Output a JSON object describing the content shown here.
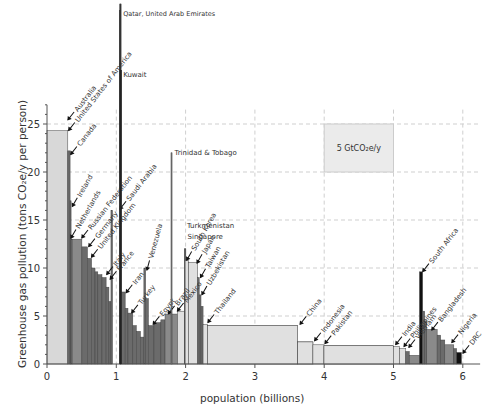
{
  "chart_data": {
    "type": "bar",
    "subtype": "variable-width bar (area = total emissions)",
    "title": "",
    "xlabel": "population (billions)",
    "ylabel": "Greenhouse gas pollution (tons CO2e/y per person)",
    "xlim": [
      0,
      6.2
    ],
    "ylim": [
      0,
      27
    ],
    "xticks": [
      0,
      1,
      2,
      3,
      4,
      5,
      6
    ],
    "yticks": [
      0,
      5,
      10,
      15,
      20,
      25
    ],
    "grid": true,
    "legend_box": {
      "label": "5 GtCO₂e/y",
      "x0": 4.0,
      "x1": 5.0,
      "y0": 20,
      "y1": 25
    },
    "bars": [
      {
        "name": "Australia",
        "x": 0.0,
        "w": 0.0,
        "h": 26.0
      },
      {
        "name": "United States of America",
        "x": 0.0,
        "w": 0.3,
        "h": 24.3
      },
      {
        "name": "Canada",
        "x": 0.3,
        "w": 0.033,
        "h": 22.2
      },
      {
        "name": "Ireland",
        "x": 0.333,
        "w": 0.01,
        "h": 17.0
      },
      {
        "name": "Netherlands",
        "x": 0.343,
        "w": 0.02,
        "h": 13.0
      },
      {
        "name": "Russian Federation",
        "x": 0.363,
        "w": 0.14,
        "h": 13.0
      },
      {
        "name": "Germany",
        "x": 0.503,
        "w": 0.08,
        "h": 12.2
      },
      {
        "name": "United Kingdom",
        "x": 0.583,
        "w": 0.06,
        "h": 11.0
      },
      {
        "name": "",
        "x": 0.643,
        "w": 0.05,
        "h": 10.0
      },
      {
        "name": "",
        "x": 0.693,
        "w": 0.04,
        "h": 9.6
      },
      {
        "name": "Italy",
        "x": 0.733,
        "w": 0.06,
        "h": 9.3
      },
      {
        "name": "France",
        "x": 0.793,
        "w": 0.06,
        "h": 9.0
      },
      {
        "name": "",
        "x": 0.853,
        "w": 0.04,
        "h": 8.0
      },
      {
        "name": "",
        "x": 0.893,
        "w": 0.03,
        "h": 6.5
      },
      {
        "name": "Saudi Arabia",
        "x": 0.923,
        "w": 0.022,
        "h": 16.0
      },
      {
        "name": "Qatar, United Arab Emirates",
        "x": 1.05,
        "w": 0.005,
        "h": 52.0
      },
      {
        "name": "Kuwait",
        "x": 1.055,
        "w": 0.003,
        "h": 38.0
      },
      {
        "name": "Iran",
        "x": 1.058,
        "w": 0.07,
        "h": 7.5
      },
      {
        "name": "",
        "x": 1.128,
        "w": 0.04,
        "h": 5.8
      },
      {
        "name": "Turkey",
        "x": 1.168,
        "w": 0.07,
        "h": 5.3
      },
      {
        "name": "",
        "x": 1.238,
        "w": 0.05,
        "h": 4.0
      },
      {
        "name": "",
        "x": 1.288,
        "w": 0.06,
        "h": 3.4
      },
      {
        "name": "",
        "x": 1.348,
        "w": 0.05,
        "h": 2.8
      },
      {
        "name": "Venezuela",
        "x": 1.398,
        "w": 0.025,
        "h": 10.0
      },
      {
        "name": "",
        "x": 1.423,
        "w": 0.04,
        "h": 6.8
      },
      {
        "name": "Egypt",
        "x": 1.463,
        "w": 0.08,
        "h": 4.0
      },
      {
        "name": "",
        "x": 1.543,
        "w": 0.1,
        "h": 4.3
      },
      {
        "name": "",
        "x": 1.643,
        "w": 0.06,
        "h": 4.6
      },
      {
        "name": "Brazil",
        "x": 1.703,
        "w": 0.18,
        "h": 5.2
      },
      {
        "name": "Trinidad & Tobago",
        "x": 1.79,
        "w": 0.002,
        "h": 22.0
      },
      {
        "name": "Mexico",
        "x": 1.883,
        "w": 0.1,
        "h": 5.5
      },
      {
        "name": "Turkmenistan",
        "x": 1.983,
        "w": 0.006,
        "h": 12.0
      },
      {
        "name": "Singapore",
        "x": 1.989,
        "w": 0.004,
        "h": 12.0
      },
      {
        "name": "South Korea",
        "x": 1.993,
        "w": 0.05,
        "h": 10.8
      },
      {
        "name": "Japan",
        "x": 2.043,
        "w": 0.13,
        "h": 10.6
      },
      {
        "name": "Taiwan",
        "x": 2.173,
        "w": 0.023,
        "h": 9.0
      },
      {
        "name": "Uzbekistan",
        "x": 2.196,
        "w": 0.026,
        "h": 7.2
      },
      {
        "name": "",
        "x": 2.222,
        "w": 0.03,
        "h": 6.0
      },
      {
        "name": "Thailand",
        "x": 2.252,
        "w": 0.065,
        "h": 4.1
      },
      {
        "name": "",
        "x": 2.317,
        "w": 1.3,
        "h": 4.0
      },
      {
        "name": "China",
        "x": 2.317,
        "w": 1.3,
        "h": 4.0
      },
      {
        "name": "",
        "x": 3.617,
        "w": 0.22,
        "h": 2.3
      },
      {
        "name": "Indonesia",
        "x": 3.617,
        "w": 0.22,
        "h": 2.3
      },
      {
        "name": "Pakistan",
        "x": 3.837,
        "w": 0.16,
        "h": 2.0
      },
      {
        "name": "",
        "x": 3.997,
        "w": 1.0,
        "h": 1.9
      },
      {
        "name": "India",
        "x": 3.997,
        "w": 1.0,
        "h": 1.9
      },
      {
        "name": "Philippines",
        "x": 4.997,
        "w": 0.09,
        "h": 1.8
      },
      {
        "name": "Vietnam",
        "x": 5.087,
        "w": 0.09,
        "h": 1.6
      },
      {
        "name": "",
        "x": 5.177,
        "w": 0.05,
        "h": 1.3
      },
      {
        "name": "",
        "x": 5.227,
        "w": 0.15,
        "h": 0.9
      },
      {
        "name": "South Africa",
        "x": 5.375,
        "w": 0.045,
        "h": 9.6
      },
      {
        "name": "",
        "x": 5.42,
        "w": 0.03,
        "h": 5.5
      },
      {
        "name": "",
        "x": 5.45,
        "w": 0.03,
        "h": 4.5
      },
      {
        "name": "Bangladesh",
        "x": 5.48,
        "w": 0.15,
        "h": 3.6
      },
      {
        "name": "",
        "x": 5.63,
        "w": 0.05,
        "h": 3.0
      },
      {
        "name": "",
        "x": 5.68,
        "w": 0.06,
        "h": 2.5
      },
      {
        "name": "Nigeria",
        "x": 5.74,
        "w": 0.13,
        "h": 2.0
      },
      {
        "name": "",
        "x": 5.87,
        "w": 0.04,
        "h": 1.6
      },
      {
        "name": "DRC",
        "x": 5.91,
        "w": 0.07,
        "h": 1.2
      }
    ],
    "annotations": [
      {
        "text": "Australia",
        "x": 0.32,
        "y": 25.6,
        "rot": -52
      },
      {
        "text": "United States of America",
        "x": 0.33,
        "y": 24.5,
        "rot": -52
      },
      {
        "text": "Canada",
        "x": 0.36,
        "y": 22.0,
        "rot": -52
      },
      {
        "text": "Ireland",
        "x": 0.38,
        "y": 16.6,
        "rot": -60
      },
      {
        "text": "Netherlands",
        "x": 0.36,
        "y": 13.3,
        "rot": -60
      },
      {
        "text": "Russian Federation",
        "x": 0.52,
        "y": 13.3,
        "rot": -52
      },
      {
        "text": "Germany",
        "x": 0.62,
        "y": 12.4,
        "rot": -52
      },
      {
        "text": "United Kingdom",
        "x": 0.66,
        "y": 11.3,
        "rot": -52
      },
      {
        "text": "Italy",
        "x": 0.88,
        "y": 9.5,
        "rot": -52
      },
      {
        "text": "France",
        "x": 0.93,
        "y": 9.0,
        "rot": -52
      },
      {
        "text": "Saudi Arabia",
        "x": 1.07,
        "y": 16.3,
        "rot": -52
      },
      {
        "text": "Iran",
        "x": 1.16,
        "y": 7.6,
        "rot": -52
      },
      {
        "text": "Turkey",
        "x": 1.24,
        "y": 5.5,
        "rot": -52
      },
      {
        "text": "Venezuela",
        "x": 1.45,
        "y": 10.0,
        "rot": -75
      },
      {
        "text": "Egypt",
        "x": 1.55,
        "y": 4.3,
        "rot": -52
      },
      {
        "text": "Brazil",
        "x": 1.77,
        "y": 5.4,
        "rot": -52
      },
      {
        "text": "Mexico",
        "x": 1.9,
        "y": 5.7,
        "rot": -52
      },
      {
        "text": "South Korea",
        "x": 2.03,
        "y": 11.0,
        "rot": -60
      },
      {
        "text": "Japan",
        "x": 2.18,
        "y": 10.7,
        "rot": -60
      },
      {
        "text": "Taiwan",
        "x": 2.23,
        "y": 9.2,
        "rot": -60
      },
      {
        "text": "Uzbekistan",
        "x": 2.25,
        "y": 7.4,
        "rot": -60
      },
      {
        "text": "Thailand",
        "x": 2.34,
        "y": 4.5,
        "rot": -52
      },
      {
        "text": "China",
        "x": 3.67,
        "y": 4.3,
        "rot": -52
      },
      {
        "text": "Indonesia",
        "x": 3.88,
        "y": 2.6,
        "rot": -52
      },
      {
        "text": "Pakistan",
        "x": 4.03,
        "y": 2.3,
        "rot": -52
      },
      {
        "text": "India",
        "x": 5.05,
        "y": 2.2,
        "rot": -52
      },
      {
        "text": "Philippines",
        "x": 5.17,
        "y": 2.0,
        "rot": -52
      },
      {
        "text": "Vietnam",
        "x": 5.24,
        "y": 1.9,
        "rot": -52
      },
      {
        "text": "South Africa",
        "x": 5.44,
        "y": 9.8,
        "rot": -52
      },
      {
        "text": "Bangladesh",
        "x": 5.57,
        "y": 3.7,
        "rot": -52
      },
      {
        "text": "Nigeria",
        "x": 5.86,
        "y": 2.4,
        "rot": -52
      },
      {
        "text": "DRC",
        "x": 6.02,
        "y": 1.3,
        "rot": -52
      }
    ],
    "flat_labels": [
      {
        "text": "Qatar, United Arab Emirates",
        "x": 1.07,
        "y": 51.0
      },
      {
        "text": "Kuwait",
        "x": 1.07,
        "y": 36.5
      },
      {
        "text": "Trinidad & Tobago",
        "x": 1.81,
        "y": 21.8
      },
      {
        "text": "Turkmenistan",
        "x": 1.99,
        "y": 14.2
      },
      {
        "text": "Singapore",
        "x": 2.0,
        "y": 13.0
      }
    ]
  },
  "colors": {
    "dark": "#2a2a2a",
    "mid": "#6b6b6b",
    "light": "#d0d0d0",
    "grid": "#cfcfcf",
    "axis": "#555555"
  }
}
